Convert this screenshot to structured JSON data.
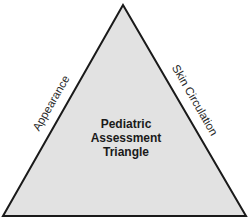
{
  "diagram": {
    "title_lines": [
      "Pediatric",
      "Assessment",
      "Triangle"
    ],
    "sides": {
      "left": "Appearance",
      "right": "Skin Circulation"
    },
    "colors": {
      "fill": "#e2e2e2",
      "stroke": "#1a1a1a",
      "background": "#ffffff"
    }
  }
}
